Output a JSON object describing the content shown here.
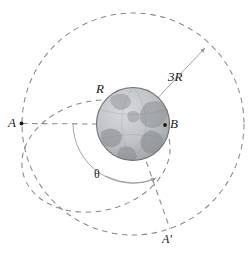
{
  "diagram": {
    "type": "orbital-mechanics-schematic",
    "colors": {
      "dashed_orbit": "#8a8a8a",
      "solid_guide": "#9a9a9a",
      "label_text": "#1a1a1a",
      "planet_outline": "#6e6e6e",
      "planet_ocean": "#b9bcc0",
      "planet_land": "#9b9ea2",
      "background": "#ffffff"
    },
    "center": {
      "x": 133,
      "y": 124,
      "label": ""
    },
    "planet": {
      "name": "earth",
      "radius_px": 37
    },
    "labels": {
      "point_a": "A",
      "point_b": "B",
      "point_a_prime": "A'",
      "radius_r": "R",
      "radius_3r": "3R",
      "angle_theta": "θ"
    },
    "points": [
      {
        "name": "A",
        "x": 21,
        "y": 123
      },
      {
        "name": "B",
        "x": 165,
        "y": 125
      },
      {
        "name": "A'",
        "x": 168,
        "y": 228
      }
    ],
    "orbits": [
      {
        "name": "outer-circular-orbit",
        "radius_px": 111,
        "style": "dashed"
      },
      {
        "name": "transfer-ellipse",
        "style": "dashed"
      }
    ],
    "radial_lines": [
      {
        "name": "radius-r-line",
        "from": "center",
        "to": "planet-surface",
        "label": "R"
      },
      {
        "name": "radius-3r-line",
        "from": "center",
        "to": "outer-orbit",
        "label": "3R"
      },
      {
        "name": "line-to-a-prime",
        "from": "center",
        "to": "A'",
        "label": ""
      }
    ],
    "angle": {
      "name": "theta",
      "label": "θ",
      "vertex": "center",
      "from_ray": "center-to-A",
      "to_ray": "center-to-A-prime"
    }
  }
}
